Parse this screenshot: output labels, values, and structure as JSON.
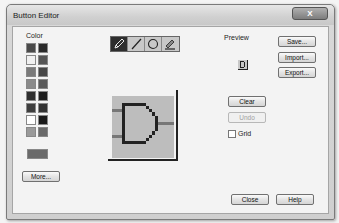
{
  "window": {
    "title": "Button Editor",
    "close_glyph": "X"
  },
  "color_panel": {
    "label": "Color",
    "swatches_left": [
      "#4a4a4a",
      "#f0f0f0",
      "#7a7a7a",
      "#8a8a8a",
      "#2e2e2e",
      "#3e3e3e",
      "#ffffff",
      "#9a9a9a"
    ],
    "swatches_right": [
      "#2a2a2a",
      "#555555",
      "#474747",
      "#5a5a5a",
      "#1e1e1e",
      "#333333",
      "#1a1a1a",
      "#6a6a6a"
    ],
    "current_color": "#6a6a6a",
    "more_label": "More..."
  },
  "tools": [
    {
      "name": "pencil",
      "active": true
    },
    {
      "name": "line",
      "active": false
    },
    {
      "name": "circle",
      "active": false
    },
    {
      "name": "fill",
      "active": false
    }
  ],
  "preview": {
    "label": "Preview"
  },
  "buttons": {
    "save": "Save...",
    "import": "Import...",
    "export": "Export...",
    "clear": "Clear",
    "undo": "Undo",
    "close": "Close",
    "help": "Help"
  },
  "grid": {
    "label": "Grid",
    "checked": false
  }
}
